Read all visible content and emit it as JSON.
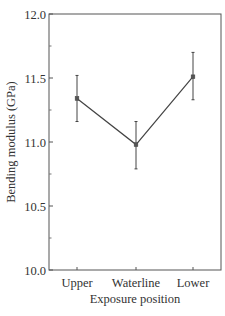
{
  "chart_data": {
    "type": "line",
    "title": "",
    "xlabel": "Exposure position",
    "ylabel": "Bending modulus  (GPa)",
    "categories": [
      "Upper",
      "Waterline",
      "Lower"
    ],
    "series": [
      {
        "name": "Bending modulus",
        "values": [
          11.34,
          10.98,
          11.51
        ],
        "error_upper": [
          11.52,
          11.16,
          11.7
        ],
        "error_lower": [
          11.16,
          10.79,
          11.33
        ]
      }
    ],
    "ylim": [
      10.0,
      12.0
    ],
    "yticks": [
      "10.0",
      "10.5",
      "11.0",
      "11.5",
      "12.0"
    ],
    "y_minor_ticks": [
      10.25,
      10.75,
      11.25,
      11.75
    ],
    "grid": false,
    "legend": "none",
    "marker": "square",
    "line_color": "#444444"
  }
}
